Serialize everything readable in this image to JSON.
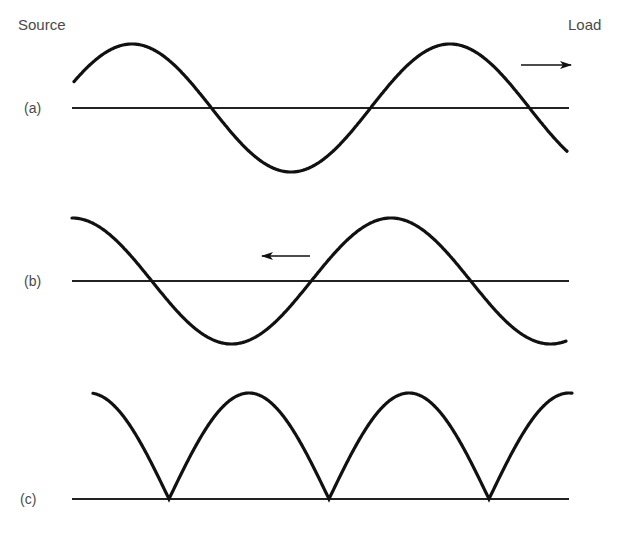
{
  "labels": {
    "source": "Source",
    "load": "Load"
  },
  "colors": {
    "curve": "#111111",
    "axis": "#222222",
    "text": "#4a4a4a",
    "background": "#ffffff"
  },
  "panels": [
    {
      "id": "a",
      "label": "(a)",
      "description": "Forward-travelling sine wave (source to load)",
      "axis": {
        "x1": 72,
        "x2": 569,
        "y": 108
      },
      "wave": {
        "type": "sine",
        "x_start": 74,
        "x_end": 567,
        "amplitude": 64,
        "period": 318,
        "peak_x": 132
      },
      "arrow": {
        "direction": "right",
        "x1": 521,
        "x2": 571,
        "y": 65
      }
    },
    {
      "id": "b",
      "label": "(b)",
      "description": "Reflected sine wave travelling back toward source",
      "axis": {
        "x1": 72,
        "x2": 569,
        "y": 281
      },
      "wave": {
        "type": "sine",
        "x_start": 72,
        "x_end": 566,
        "amplitude": 63,
        "period": 319,
        "peak_x": 391
      },
      "arrow": {
        "direction": "left",
        "x1": 310,
        "x2": 262,
        "y": 256
      }
    },
    {
      "id": "c",
      "label": "(c)",
      "description": "Standing wave envelope (rectified)",
      "axis": {
        "x1": 72,
        "x2": 569,
        "y": 499
      },
      "wave": {
        "type": "abs-cosine",
        "x_start": 93,
        "x_end": 572,
        "amplitude": 106,
        "period": 320,
        "peak_x": 89
      },
      "arrow": null
    }
  ]
}
